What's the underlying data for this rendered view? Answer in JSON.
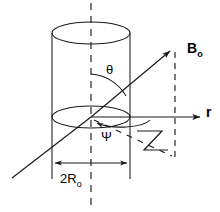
{
  "figure": {
    "background_color": "#ffffff",
    "stroke_color": "#1a1a1a",
    "width": 220,
    "height": 212
  },
  "labels": {
    "field_vector": "B",
    "field_vector_subscript": "o",
    "radial_axis": "r",
    "polar_angle": "θ",
    "azimuthal_angle": "Ψ",
    "diameter_prefix": "2R",
    "diameter_subscript": "o"
  },
  "geometry": {
    "cylinder": {
      "center_x": 91,
      "top_ellipse_cy": 33,
      "bottom_ellipse_cy": 117,
      "rx": 39,
      "ry": 11,
      "wall_left_x": 52,
      "wall_right_x": 130,
      "wall_top_y": 33,
      "wall_bottom_y": 179
    },
    "center_axis": {
      "x": 91,
      "y_top": 3,
      "y_bottom": 206
    },
    "right_dashed_axis": {
      "x": 175,
      "y_top": 52,
      "y_bottom": 158
    },
    "field_line": {
      "x1": 12,
      "y1": 178,
      "x2": 173,
      "y2": 48
    },
    "radial_axis_line": {
      "x1": 91,
      "y1": 117,
      "x2": 203,
      "y2": 117
    },
    "dimension_line": {
      "x1": 52,
      "x2": 130,
      "y": 163
    }
  },
  "elements": {
    "cylinder_body": "open cylinder drawn with top and bottom ellipses and two vertical walls",
    "field_arrow": "arrow pointing up-right labeled B sub o",
    "radial_arrow": "horizontal arrow pointing right labeled r",
    "theta_arc": "arc from vertical dashed axis to field line",
    "psi_arc": "arc in the horizontal plane from radial axis to field projection",
    "projection_lines": "dashed projection of field vector onto base plane",
    "right_angle_marker": "small solid angle marker between projection and vertical drop",
    "diameter_dimension": "double headed arrow spanning cylinder width"
  }
}
